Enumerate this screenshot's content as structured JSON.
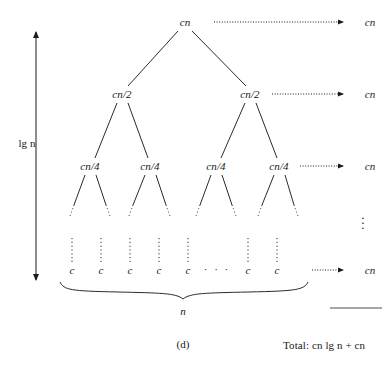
{
  "figure": {
    "caption": "(d)",
    "total_label": "Total: cn lg n + cn",
    "depth_label": "lg n",
    "width_label": "n",
    "horizontal_ellipsis": "· · ·",
    "vertical_ellipsis": "⋮"
  },
  "tree": {
    "levels": [
      {
        "id": "level-0",
        "y": 22,
        "node_label": "cn",
        "nodes": [
          {
            "x": 185,
            "label": "cn"
          }
        ],
        "row_cost": "cn",
        "arrow": {
          "x1": 218,
          "x2": 345,
          "y": 22
        },
        "cost_x": 370
      },
      {
        "id": "level-1",
        "y": 94,
        "node_label": "cn/2",
        "nodes": [
          {
            "x": 122,
            "label": "cn/2"
          },
          {
            "x": 250,
            "label": "cn/2"
          }
        ],
        "row_cost": "cn",
        "arrow": {
          "x1": 272,
          "x2": 345,
          "y": 94
        },
        "cost_x": 370
      },
      {
        "id": "level-2",
        "y": 166,
        "node_label": "cn/4",
        "nodes": [
          {
            "x": 90,
            "label": "cn/4"
          },
          {
            "x": 150,
            "label": "cn/4"
          },
          {
            "x": 216,
            "label": "cn/4"
          },
          {
            "x": 279,
            "label": "cn/4"
          }
        ],
        "row_cost": "cn",
        "arrow": {
          "x1": 302,
          "x2": 345,
          "y": 166
        },
        "cost_x": 370
      },
      {
        "id": "level-leaf",
        "y": 270,
        "node_label": "c",
        "nodes": [
          {
            "x": 72,
            "label": "c"
          },
          {
            "x": 101,
            "label": "c"
          },
          {
            "x": 130,
            "label": "c"
          },
          {
            "x": 159,
            "label": "c"
          },
          {
            "x": 188,
            "label": "c"
          },
          {
            "x": 248,
            "label": "c"
          },
          {
            "x": 277,
            "label": "c"
          }
        ],
        "row_cost": "cn",
        "arrow": {
          "x1": 312,
          "x2": 345,
          "y": 270
        },
        "cost_x": 370
      }
    ],
    "leaf_ellipsis_x": 217,
    "leaf_ellipsis_y": 269
  },
  "annotations": {
    "right_vertical_ellipsis": {
      "x": 363,
      "y": 222
    },
    "depth_arrow": {
      "x": 36,
      "y_top": 28,
      "y_bottom": 284
    },
    "depth_label_pos": {
      "x": 27,
      "y": 143
    },
    "brace": {
      "x_left": 60,
      "x_right": 312,
      "y": 284
    },
    "width_label_pos": {
      "x": 183,
      "y": 311
    },
    "total_rule": {
      "x1": 330,
      "x2": 382,
      "y": 308
    },
    "total_label_pos": {
      "x": 331,
      "y": 345
    },
    "caption_pos": {
      "x": 183,
      "y": 344
    }
  },
  "colors": {
    "ink": "#1a1a1a",
    "line": "#2b2b2b",
    "rule": "#8a8a8a",
    "background": "#ffffff"
  }
}
